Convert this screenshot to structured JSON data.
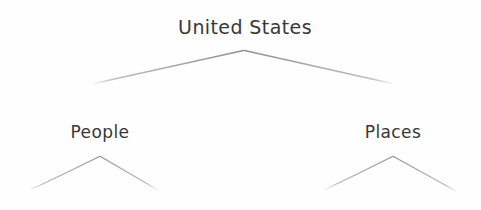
{
  "diagram": {
    "title_node": "United States",
    "background_color": "#fefefe",
    "text_color": "#373737",
    "branch_color": "#a8a8a8",
    "nodes": [
      {
        "id": "root",
        "label": "United States",
        "x": 245,
        "y": 28
      },
      {
        "id": "people",
        "label": "People",
        "x": 100,
        "y": 133
      },
      {
        "id": "places",
        "label": "Places",
        "x": 393,
        "y": 133
      }
    ],
    "branches": [
      {
        "from": "root",
        "apex_x": 244,
        "apex_y": 50,
        "left_x": 94,
        "left_y": 83,
        "right_x": 392,
        "right_y": 83
      },
      {
        "from": "people",
        "apex_x": 100,
        "apex_y": 156,
        "left_x": 31,
        "left_y": 189,
        "right_x": 157,
        "right_y": 189
      },
      {
        "from": "places",
        "apex_x": 393,
        "apex_y": 156,
        "left_x": 325,
        "left_y": 189,
        "right_x": 456,
        "right_y": 191
      }
    ]
  }
}
